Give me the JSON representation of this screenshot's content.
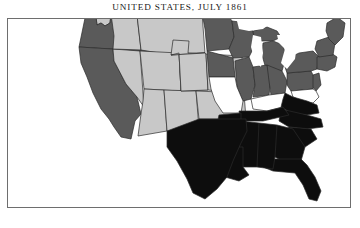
{
  "map": {
    "title": "UNITED STATES, JULY 1861",
    "frame": {
      "x": 7,
      "y": 18,
      "width": 344,
      "height": 190
    },
    "legend_colors": {
      "confederate": "#0d0d0d",
      "union": "#5a5a5a",
      "territory": "#c8c8c8",
      "border_state": "#ffffff",
      "water": "#ffffff",
      "outline": "#2b2b2b",
      "frame_border": "#6e6e6e",
      "background": "#ffffff",
      "title_text": "#1a1a1a"
    },
    "categories": [
      {
        "key": "confederate",
        "label": "Confederate States",
        "fill": "#0d0d0d"
      },
      {
        "key": "union",
        "label": "Union Free States",
        "fill": "#5a5a5a"
      },
      {
        "key": "territory",
        "label": "Western Territories",
        "fill": "#c8c8c8"
      },
      {
        "key": "border_state",
        "label": "Border States",
        "fill": "#ffffff"
      }
    ],
    "regions": [
      {
        "name": "washington-territory",
        "label": "Washington Territory",
        "category": "territory",
        "path": "M93,5 L101,3 L113,2 L114,10 L110,13 L109,22 L104,25 L100,22 L96,24 L95,16 L92,12 Z"
      },
      {
        "name": "oregon",
        "label": "Oregon",
        "category": "union",
        "path": "M84,17 L95,16 L96,24 L100,22 L104,25 L109,22 L110,13 L170,20 L168,52 L78,46 Z"
      },
      {
        "name": "california",
        "label": "California",
        "category": "union",
        "path": "M78,46 L112,48 L113,60 L125,83 L136,96 L140,113 L134,120 L130,138 L120,136 L113,126 L108,118 L100,108 L92,92 L86,76 L80,62 Z"
      },
      {
        "name": "nevada-territory",
        "label": "Nevada Territory",
        "category": "territory",
        "path": "M112,48 L139,50 L143,106 L136,96 L125,83 L113,60 Z"
      },
      {
        "name": "idaho-area",
        "label": "Washington Territory (east)",
        "category": "territory",
        "path": "M110,13 L136,14 L140,49 L112,48 L113,35 Z"
      },
      {
        "name": "dakota-territory",
        "label": "Dakota Territory",
        "category": "territory",
        "path": "M136,14 L201,12 L204,52 L170,54 L140,49 Z"
      },
      {
        "name": "utah-territory",
        "label": "Utah Territory",
        "category": "territory",
        "path": "M139,50 L178,52 L180,90 L143,88 Z"
      },
      {
        "name": "new-mexico-west",
        "label": "New Mexico Territory (west)",
        "category": "territory",
        "path": "M143,88 L163,89 L166,130 L137,135 L140,113 L142,100 Z"
      },
      {
        "name": "new-mexico-east",
        "label": "New Mexico Territory (east)",
        "category": "territory",
        "path": "M163,89 L195,90 L198,128 L166,130 Z"
      },
      {
        "name": "colorado-territory",
        "label": "Colorado Territory",
        "category": "territory",
        "path": "M178,52 L205,53 L207,89 L180,90 Z"
      },
      {
        "name": "nebraska-territory",
        "label": "Nebraska Territory",
        "category": "territory",
        "path": "M204,52 L187,52 L188,40 L172,39 L170,54 Z"
      },
      {
        "name": "nebraska-territory-main",
        "label": "Nebraska Territory (main)",
        "category": "territory",
        "path": "M170,54 L204,52 L205,53 L207,89 L180,90 L178,52 Z"
      },
      {
        "name": "kansas-territory",
        "label": "Kansas",
        "category": "territory",
        "path": "M205,53 L241,55 L243,92 L207,89 Z"
      },
      {
        "name": "indian-territory",
        "label": "Indian Territory",
        "category": "territory",
        "path": "M195,90 L243,92 L245,118 L198,118 Z"
      },
      {
        "name": "minnesota",
        "label": "Minnesota",
        "category": "union",
        "path": "M201,12 L224,10 L231,20 L233,36 L228,48 L206,50 L204,28 Z"
      },
      {
        "name": "wisconsin",
        "label": "Wisconsin",
        "category": "union",
        "path": "M231,20 L246,22 L252,30 L254,44 L248,56 L232,57 L228,48 L233,36 Z"
      },
      {
        "name": "iowa",
        "label": "Iowa",
        "category": "union",
        "path": "M206,50 L232,57 L234,76 L208,76 Z"
      },
      {
        "name": "michigan-upper",
        "label": "Michigan (Upper Peninsula)",
        "category": "union",
        "path": "M252,30 L266,26 L276,30 L280,36 L272,40 L258,40 L253,36 Z"
      },
      {
        "name": "michigan-lower",
        "label": "Michigan (Lower Peninsula)",
        "category": "union",
        "path": "M262,42 L272,40 L282,44 L285,56 L281,70 L272,76 L265,68 L261,54 Z"
      },
      {
        "name": "illinois",
        "label": "Illinois",
        "category": "union",
        "path": "M234,60 L248,56 L252,66 L254,84 L250,98 L242,100 L236,86 Z"
      },
      {
        "name": "indiana",
        "label": "Indiana",
        "category": "union",
        "path": "M252,66 L266,64 L270,78 L268,94 L252,96 L254,84 Z"
      },
      {
        "name": "ohio",
        "label": "Ohio",
        "category": "union",
        "path": "M266,64 L281,70 L286,80 L284,92 L270,94 L268,80 Z"
      },
      {
        "name": "pennsylvania",
        "label": "Pennsylvania",
        "category": "union",
        "path": "M286,72 L310,70 L314,78 L312,88 L290,90 L286,84 Z"
      },
      {
        "name": "new-york",
        "label": "New York",
        "category": "union",
        "path": "M286,58 L298,52 L312,50 L318,56 L316,68 L310,70 L286,72 L284,66 Z"
      },
      {
        "name": "new-jersey",
        "label": "New Jersey",
        "category": "union",
        "path": "M312,74 L318,72 L320,84 L315,90 L312,86 Z"
      },
      {
        "name": "new-england-south",
        "label": "Connecticut / Rhode Island / Massachusetts",
        "category": "union",
        "path": "M316,56 L330,52 L336,56 L334,66 L326,70 L316,68 Z"
      },
      {
        "name": "vermont-new-hampshire",
        "label": "Vermont / New Hampshire",
        "category": "union",
        "path": "M316,40 L328,36 L334,42 L332,54 L318,56 L314,48 Z"
      },
      {
        "name": "maine",
        "label": "Maine",
        "category": "union",
        "path": "M326,22 L336,16 L344,22 L342,36 L334,44 L328,38 L325,30 Z"
      },
      {
        "name": "missouri",
        "label": "Missouri",
        "category": "border_state",
        "path": "M208,76 L234,76 L236,86 L242,100 L240,112 L222,112 L214,100 L210,88 Z"
      },
      {
        "name": "kentucky",
        "label": "Kentucky",
        "category": "border_state",
        "path": "M250,98 L268,94 L284,92 L290,98 L282,106 L266,110 L252,108 Z"
      },
      {
        "name": "maryland-delaware",
        "label": "Maryland / Delaware",
        "category": "border_state",
        "path": "M290,90 L312,88 L315,90 L318,96 L312,102 L300,100 L292,96 Z"
      },
      {
        "name": "virginia",
        "label": "Virginia",
        "category": "confederate",
        "path": "M284,92 L292,96 L306,100 L316,104 L318,112 L306,114 L290,112 L280,106 L282,98 Z"
      },
      {
        "name": "north-carolina",
        "label": "North Carolina",
        "category": "confederate",
        "path": "M280,108 L306,114 L320,118 L322,126 L306,128 L288,126 L278,120 Z"
      },
      {
        "name": "south-carolina",
        "label": "South Carolina",
        "category": "confederate",
        "path": "M288,126 L310,128 L316,138 L304,146 L292,140 L284,132 Z"
      },
      {
        "name": "georgia",
        "label": "Georgia",
        "category": "confederate",
        "path": "M276,124 L292,128 L304,146 L300,160 L288,164 L274,156 L270,138 Z"
      },
      {
        "name": "florida",
        "label": "Florida",
        "category": "confederate",
        "path": "M266,158 L300,158 L306,164 L314,176 L320,190 L316,200 L308,198 L302,184 L294,172 L272,170 L262,166 Z"
      },
      {
        "name": "alabama",
        "label": "Alabama",
        "category": "confederate",
        "path": "M258,122 L276,124 L274,156 L272,168 L256,166 L254,140 Z"
      },
      {
        "name": "mississippi",
        "label": "Mississippi",
        "category": "confederate",
        "path": "M240,120 L258,122 L256,166 L242,166 L238,146 Z"
      },
      {
        "name": "tennessee",
        "label": "Tennessee",
        "category": "confederate",
        "path": "M238,110 L266,110 L282,106 L288,114 L262,120 L240,120 Z"
      },
      {
        "name": "arkansas",
        "label": "Arkansas",
        "category": "confederate",
        "path": "M218,114 L240,112 L240,120 L238,146 L222,146 L214,132 Z"
      },
      {
        "name": "louisiana",
        "label": "Louisiana",
        "category": "confederate",
        "path": "M218,146 L242,146 L242,166 L248,174 L238,180 L224,176 L214,164 Z"
      },
      {
        "name": "texas",
        "label": "Texas",
        "category": "confederate",
        "path": "M166,130 L198,118 L245,118 L246,130 L240,142 L232,160 L226,176 L216,188 L204,198 L192,192 L186,178 L176,160 L166,146 Z"
      },
      {
        "name": "lake-michigan",
        "label": "Lake Michigan",
        "category": "water",
        "path": "M252,34 L260,36 L262,52 L260,66 L254,60 L250,46 Z"
      },
      {
        "name": "lake-superior",
        "label": "Lake Superior",
        "category": "water",
        "path": "M236,20 L256,18 L270,22 L262,28 L248,30 L238,28 Z"
      },
      {
        "name": "lake-huron-erie",
        "label": "Lake Huron / Lake Erie",
        "category": "water",
        "path": "M276,34 L290,34 L296,44 L294,58 L286,68 L280,62 L284,48 L278,42 Z"
      }
    ]
  }
}
